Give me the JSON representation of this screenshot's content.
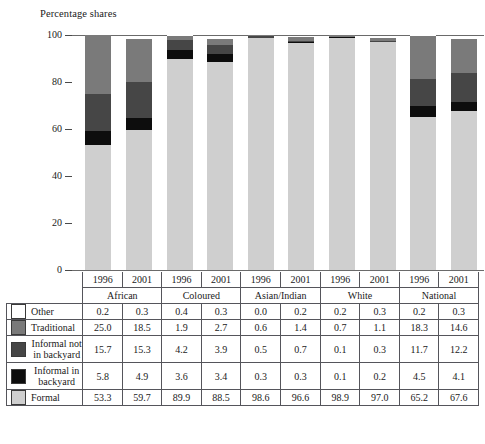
{
  "top_fragment": "",
  "axis_title": "Percentage shares",
  "chart_data": {
    "type": "bar",
    "stacked": true,
    "title": "Percentage shares",
    "xlabel": "",
    "ylabel": "Percentage shares",
    "ylim": [
      0,
      100
    ],
    "yticks": [
      0,
      20,
      40,
      60,
      80,
      100
    ],
    "grid": false,
    "legend_position": "table-left",
    "groups": [
      "African",
      "Coloured",
      "Asian/Indian",
      "White",
      "National"
    ],
    "years": [
      "1996",
      "2001"
    ],
    "categories": [
      "African 1996",
      "African 2001",
      "Coloured 1996",
      "Coloured 2001",
      "Asian/Indian 1996",
      "Asian/Indian 2001",
      "White 1996",
      "White 2001",
      "National 1996",
      "National 2001"
    ],
    "series": [
      {
        "name": "Other",
        "color": "#ffffff",
        "values": [
          0.2,
          0.3,
          0.4,
          0.3,
          0.0,
          0.2,
          0.2,
          0.3,
          0.2,
          0.3
        ]
      },
      {
        "name": "Traditional",
        "color": "#7a7a7a",
        "values": [
          25.0,
          18.5,
          1.9,
          2.7,
          0.6,
          1.4,
          0.7,
          1.1,
          18.3,
          14.6
        ]
      },
      {
        "name": "Informal not in backyard",
        "color": "#464646",
        "values": [
          15.7,
          15.3,
          4.2,
          3.9,
          0.5,
          0.7,
          0.1,
          0.3,
          11.7,
          12.2
        ]
      },
      {
        "name": "Informal in backyard",
        "color": "#0d0d0d",
        "values": [
          5.8,
          4.9,
          3.6,
          3.4,
          0.3,
          0.3,
          0.1,
          0.2,
          4.5,
          4.1
        ]
      },
      {
        "name": "Formal",
        "color": "#cfcfcf",
        "values": [
          53.3,
          59.7,
          89.9,
          88.5,
          98.6,
          96.6,
          98.9,
          97.0,
          65.2,
          67.6
        ]
      }
    ]
  },
  "table": {
    "year_headers": [
      "1996",
      "2001",
      "1996",
      "2001",
      "1996",
      "2001",
      "1996",
      "2001",
      "1996",
      "2001"
    ],
    "group_headers": [
      "African",
      "Coloured",
      "Asian/Indian",
      "White",
      "National"
    ],
    "rows": [
      {
        "label": "Other",
        "swatch": "#ffffff",
        "values": [
          "0.2",
          "0.3",
          "0.4",
          "0.3",
          "0.0",
          "0.2",
          "0.2",
          "0.3",
          "0.2",
          "0.3"
        ]
      },
      {
        "label": "Traditional",
        "swatch": "#7a7a7a",
        "values": [
          "25.0",
          "18.5",
          "1.9",
          "2.7",
          "0.6",
          "1.4",
          "0.7",
          "1.1",
          "18.3",
          "14.6"
        ]
      },
      {
        "label": "Informal not in backyard",
        "swatch": "#464646",
        "values": [
          "15.7",
          "15.3",
          "4.2",
          "3.9",
          "0.5",
          "0.7",
          "0.1",
          "0.3",
          "11.7",
          "12.2"
        ]
      },
      {
        "label": "Informal in backyard",
        "swatch": "#0d0d0d",
        "values": [
          "5.8",
          "4.9",
          "3.6",
          "3.4",
          "0.3",
          "0.3",
          "0.1",
          "0.2",
          "4.5",
          "4.1"
        ]
      },
      {
        "label": "Formal",
        "swatch": "#cfcfcf",
        "values": [
          "53.3",
          "59.7",
          "89.9",
          "88.5",
          "98.6",
          "96.6",
          "98.9",
          "97.0",
          "65.2",
          "67.6"
        ]
      }
    ]
  }
}
